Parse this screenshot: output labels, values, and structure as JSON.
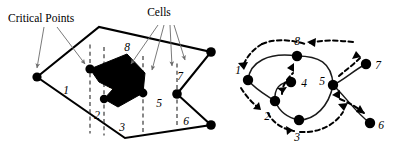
{
  "figure": {
    "width": 397,
    "height": 156,
    "background": "#ffffff",
    "ink": "#000000",
    "leader_color": "#6b6b6b",
    "slice_color": "#3a3a3a"
  },
  "annotations": {
    "critical_points_label": "Critical Points",
    "cells_label": "Cells"
  },
  "left_panel": {
    "name": "boustrophedon-cell-decomposition",
    "boundary_vertices": [
      [
        37,
        77
      ],
      [
        99,
        27
      ],
      [
        211,
        52
      ],
      [
        177,
        94
      ],
      [
        211,
        125
      ],
      [
        125,
        138
      ]
    ],
    "obstacle_vertices": [
      [
        90,
        69
      ],
      [
        126,
        55
      ],
      [
        144,
        74
      ],
      [
        143,
        93
      ],
      [
        117,
        106
      ],
      [
        104,
        99
      ],
      [
        112,
        90
      ],
      [
        99,
        82
      ]
    ],
    "critical_points": [
      [
        90,
        69
      ],
      [
        104,
        99
      ],
      [
        143,
        93
      ],
      [
        177,
        94
      ]
    ],
    "slice_lines": [
      {
        "x": 90,
        "y1": 44,
        "y2": 134
      },
      {
        "x": 104,
        "y1": 47,
        "y2": 136
      },
      {
        "x": 143,
        "y1": 56,
        "y2": 133
      },
      {
        "x": 177,
        "y1": 63,
        "y2": 127
      }
    ],
    "cell_labels": [
      {
        "id": "1",
        "x": 66,
        "y": 94
      },
      {
        "id": "2",
        "x": 96,
        "y": 118
      },
      {
        "id": "3",
        "x": 122,
        "y": 130
      },
      {
        "id": "4",
        "x": 112,
        "y": 89
      },
      {
        "id": "5",
        "x": 159,
        "y": 107
      },
      {
        "id": "6",
        "x": 186,
        "y": 124
      },
      {
        "id": "7",
        "x": 180,
        "y": 79
      },
      {
        "id": "8",
        "x": 127,
        "y": 50
      }
    ],
    "critical_points_leaders": [
      {
        "from": [
          44,
          26
        ],
        "to": [
          38,
          70
        ]
      },
      {
        "from": [
          55,
          26
        ],
        "to": [
          86,
          66
        ]
      }
    ],
    "cells_leaders": [
      {
        "from": [
          160,
          24
        ],
        "to": [
          132,
          66
        ]
      },
      {
        "from": [
          164,
          24
        ],
        "to": [
          151,
          72
        ]
      },
      {
        "from": [
          169,
          24
        ],
        "to": [
          171,
          68
        ]
      },
      {
        "from": [
          172,
          24
        ],
        "to": [
          184,
          62
        ]
      }
    ]
  },
  "right_panel": {
    "name": "adjacency-graph",
    "nodes": [
      {
        "id": "1",
        "x": 248,
        "y": 80,
        "label_x": 238,
        "label_y": 74
      },
      {
        "id": "2",
        "x": 275,
        "y": 101,
        "label_x": 266,
        "label_y": 119
      },
      {
        "id": "3",
        "x": 299,
        "y": 120,
        "label_x": 296,
        "label_y": 139
      },
      {
        "id": "4",
        "x": 291,
        "y": 82,
        "label_x": 301,
        "label_y": 88
      },
      {
        "id": "5",
        "x": 333,
        "y": 85,
        "label_x": 320,
        "label_y": 85
      },
      {
        "id": "6",
        "x": 370,
        "y": 123,
        "label_x": 379,
        "label_y": 129
      },
      {
        "id": "7",
        "x": 366,
        "y": 64,
        "label_x": 376,
        "label_y": 69
      },
      {
        "id": "8",
        "x": 297,
        "y": 56,
        "label_x": 293,
        "label_y": 44
      }
    ],
    "edges": [
      {
        "from": "1",
        "to": "8",
        "type": "curve"
      },
      {
        "from": "8",
        "to": "5",
        "type": "curve"
      },
      {
        "from": "1",
        "to": "2",
        "type": "curve"
      },
      {
        "from": "2",
        "to": "4",
        "type": "curve"
      },
      {
        "from": "2",
        "to": "3",
        "type": "curve"
      },
      {
        "from": "3",
        "to": "5",
        "type": "curve"
      },
      {
        "from": "5",
        "to": "7",
        "type": "curve"
      },
      {
        "from": "5",
        "to": "6",
        "type": "curve"
      }
    ],
    "traversal_order": [
      "1",
      "2",
      "4",
      "2",
      "3",
      "5",
      "6",
      "5",
      "7",
      "5",
      "8",
      "1"
    ]
  }
}
